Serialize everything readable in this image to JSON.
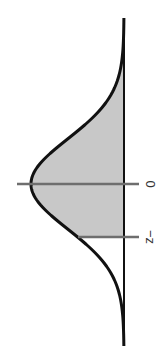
{
  "chart_data": {
    "type": "area",
    "title": "",
    "subtitle": "",
    "distribution": "standard normal",
    "orientation": "rotated-90-clockwise",
    "xlabel": "",
    "ylabel": "",
    "tick_labels": [
      "0",
      "−z"
    ],
    "ticks": [
      {
        "label": "0",
        "value": 0
      },
      {
        "label": "−z",
        "value": -1
      }
    ],
    "shaded_region": {
      "from": "−z",
      "to": "+∞",
      "from_value": -1,
      "to_value": 3.5
    },
    "xlim": [
      -3.5,
      3.5
    ],
    "grid": false,
    "legend": null
  },
  "colors": {
    "curve": "#111111",
    "axis": "#111111",
    "shade": "#c8c8c8",
    "tick": "#6e6e6e",
    "label": "#333333",
    "background": "#ffffff"
  },
  "labels": {
    "zero": "0",
    "neg_z": "−z"
  }
}
